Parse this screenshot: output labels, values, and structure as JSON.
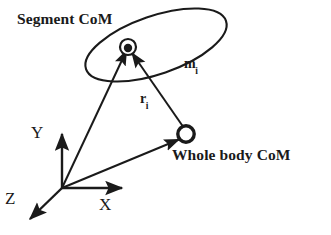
{
  "figure": {
    "type": "biomechanics-center-of-mass-diagram",
    "background_color": "#ffffff",
    "stroke_color": "#1a1a1a",
    "labels": {
      "segment_com": "Segment CoM",
      "whole_body_com": "Whole body CoM",
      "segment_mass_base": "m",
      "segment_mass_sub": "i",
      "position_vector_base": "r",
      "position_vector_sub": "i",
      "axis_y": "Y",
      "axis_x": "X",
      "axis_z": "Z"
    },
    "geometry": {
      "origin": {
        "x": 62,
        "y": 188
      },
      "segment_com_point": {
        "x": 128,
        "y": 47
      },
      "whole_body_com_point": {
        "x": 186,
        "y": 135
      },
      "ellipse": {
        "cx": 156,
        "cy": 45,
        "rx": 74,
        "ry": 29,
        "rotation_deg": -19
      },
      "axis_y_tip": {
        "x": 62,
        "y": 129
      },
      "axis_x_tip": {
        "x": 127,
        "y": 188
      },
      "axis_z_tip": {
        "x": 26,
        "y": 223
      }
    }
  }
}
